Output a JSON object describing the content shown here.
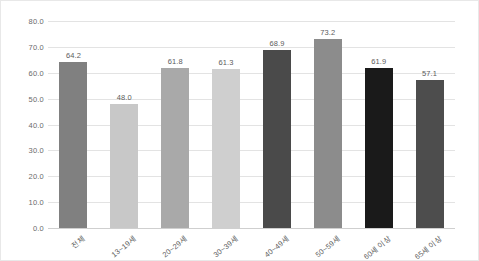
{
  "chart_data": {
    "type": "bar",
    "title": "",
    "subtitle": "",
    "xlabel": "",
    "ylabel": "",
    "ylim": [
      0,
      80
    ],
    "grid": true,
    "legend": "none",
    "categories": [
      "전체",
      "13~19세",
      "20~29세",
      "30~39세",
      "40~49세",
      "50~59세",
      "60세 이상",
      "65세 이상"
    ],
    "values": [
      64.2,
      48.0,
      61.8,
      61.3,
      68.9,
      73.2,
      61.9,
      57.1
    ],
    "value_labels": [
      "64.2",
      "48.0",
      "61.8",
      "61.3",
      "68.9",
      "73.2",
      "61.9",
      "57.1"
    ],
    "bar_colors": [
      "#808080",
      "#c8c8c8",
      "#a9a9a9",
      "#cfcfcf",
      "#4a4a4a",
      "#8c8c8c",
      "#1a1a1a",
      "#4d4d4d"
    ],
    "yticks": [
      0,
      10,
      20,
      30,
      40,
      50,
      60,
      70,
      80
    ],
    "ytick_labels": [
      "0.0",
      "10.0",
      "20.0",
      "30.0",
      "40.0",
      "50.0",
      "60.0",
      "70.0",
      "80.0"
    ],
    "axis_color": "#e3e3e3",
    "baseline_color": "#cfcfcf",
    "text_color": "#5c5c5c",
    "background": "#ffffff"
  }
}
